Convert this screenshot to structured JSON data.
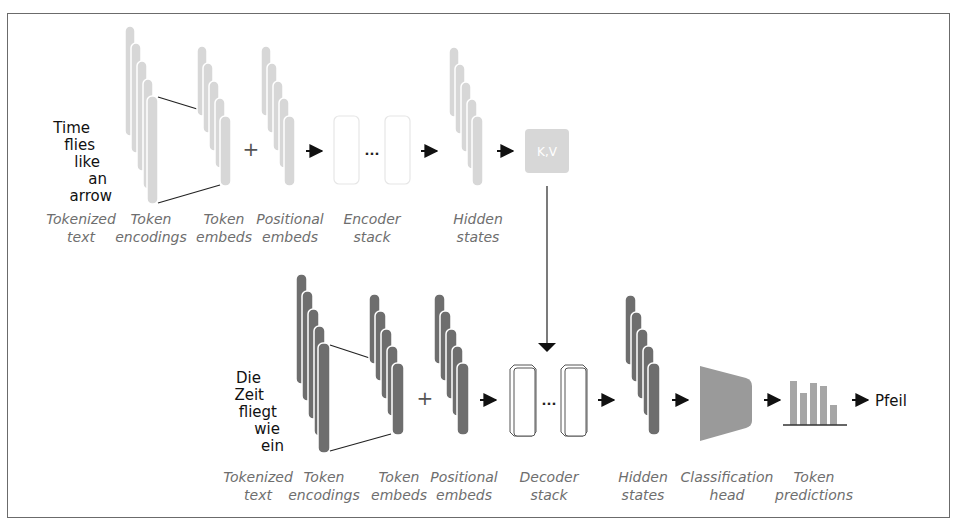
{
  "diagram": {
    "colors": {
      "encoder_fill": "#d7d7d7",
      "decoder_fill": "#6e6e6e",
      "head_fill": "#9a9a9a",
      "bar_fill": "#a6a6a6",
      "label_color": "#6e6e6e",
      "frame_color": "#6b6b6b"
    },
    "encoder": {
      "input_tokens": [
        "Time",
        "flies",
        "like",
        "an",
        "arrow"
      ],
      "labels": {
        "tokenized_text": [
          "Tokenized",
          "text"
        ],
        "token_encodings": [
          "Token",
          "encodings"
        ],
        "token_embeds": [
          "Token",
          "embeds"
        ],
        "positional_embeds": [
          "Positional",
          "embeds"
        ],
        "stack": [
          "Encoder",
          "stack"
        ],
        "hidden_states": [
          "Hidden",
          "states"
        ]
      },
      "plus": "+",
      "ellipsis": "...",
      "kv_label": "K,V"
    },
    "decoder": {
      "input_tokens": [
        "Die",
        "Zeit",
        "fliegt",
        "wie",
        "ein"
      ],
      "labels": {
        "tokenized_text": [
          "Tokenized",
          "text"
        ],
        "token_encodings": [
          "Token",
          "encodings"
        ],
        "token_embeds": [
          "Token",
          "embeds"
        ],
        "positional_embeds": [
          "Positional",
          "embeds"
        ],
        "stack": [
          "Decoder",
          "stack"
        ],
        "hidden_states": [
          "Hidden",
          "states"
        ],
        "classification_head": [
          "Classification",
          "head"
        ],
        "token_predictions": [
          "Token",
          "predictions"
        ]
      },
      "plus": "+",
      "ellipsis": "...",
      "prediction_bars": [
        0.85,
        0.6,
        0.8,
        0.72,
        0.35
      ],
      "output_token": "Pfeil"
    }
  }
}
